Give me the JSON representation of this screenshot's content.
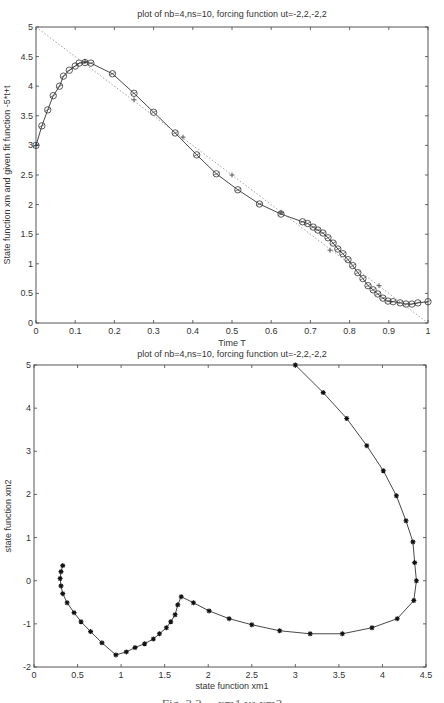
{
  "chart_data": [
    {
      "type": "line",
      "title": "plot of nb=4,ns=10, forcing function ut=-2,2,-2,2",
      "xlabel": "Time T",
      "ylabel": "State function xm and given fit function -5*t+t",
      "xlim": [
        0,
        1
      ],
      "ylim": [
        0,
        5
      ],
      "xticks": [
        "0",
        "0.1",
        "0.2",
        "0.3",
        "0.4",
        "0.5",
        "0.6",
        "0.7",
        "0.8",
        "0.9",
        "1"
      ],
      "yticks": [
        "0",
        "0.5",
        "1",
        "1.5",
        "2",
        "2.5",
        "3",
        "3.5",
        "4",
        "4.5",
        "5"
      ],
      "grid": false,
      "series": [
        {
          "name": "state function xm",
          "style": "solid line with circle markers",
          "x": [
            0,
            0.015,
            0.03,
            0.044,
            0.06,
            0.07,
            0.085,
            0.1,
            0.11,
            0.125,
            0.14,
            0.195,
            0.25,
            0.3,
            0.355,
            0.41,
            0.46,
            0.515,
            0.57,
            0.625,
            0.68,
            0.693,
            0.707,
            0.719,
            0.732,
            0.745,
            0.758,
            0.77,
            0.783,
            0.796,
            0.808,
            0.821,
            0.834,
            0.847,
            0.86,
            0.872,
            0.885,
            0.898,
            0.911,
            0.929,
            0.944,
            0.959,
            0.974,
            1.0
          ],
          "y": [
            3.0,
            3.33,
            3.6,
            3.84,
            4.0,
            4.17,
            4.27,
            4.34,
            4.39,
            4.4,
            4.39,
            4.21,
            3.88,
            3.56,
            3.21,
            2.84,
            2.52,
            2.25,
            2.01,
            1.84,
            1.71,
            1.68,
            1.62,
            1.57,
            1.52,
            1.44,
            1.35,
            1.25,
            1.17,
            1.07,
            0.97,
            0.85,
            0.75,
            0.63,
            0.56,
            0.49,
            0.42,
            0.37,
            0.36,
            0.34,
            0.32,
            0.32,
            0.34,
            0.36
          ]
        },
        {
          "name": "fit points",
          "style": "plus markers",
          "x": [
            0,
            0.125,
            0.25,
            0.375,
            0.5,
            0.625,
            0.75,
            0.875
          ],
          "y": [
            3.0,
            4.42,
            3.77,
            3.14,
            2.5,
            1.87,
            1.23,
            0.63
          ]
        },
        {
          "name": "given fit function",
          "style": "dotted line",
          "x": [
            0,
            1
          ],
          "y": [
            5,
            0
          ]
        }
      ]
    },
    {
      "type": "line",
      "title": "plot of nb=4,ns=10, forcing function ut=-2,2,-2,2",
      "xlabel": "state function xm1",
      "ylabel": "state function xm2",
      "xlim": [
        0,
        4.5
      ],
      "ylim": [
        -2,
        5
      ],
      "xticks": [
        "0",
        "0.5",
        "1",
        "1.5",
        "2",
        "2.5",
        "3",
        "3.5",
        "4",
        "4.5"
      ],
      "yticks": [
        "-2",
        "-1",
        "0",
        "1",
        "2",
        "3",
        "4",
        "5"
      ],
      "grid": false,
      "series": [
        {
          "name": "phase trajectory xm1 vs xm2",
          "style": "solid line with star markers",
          "x": [
            0.33,
            0.31,
            0.3,
            0.31,
            0.33,
            0.38,
            0.46,
            0.54,
            0.65,
            0.78,
            0.94,
            1.06,
            1.16,
            1.27,
            1.37,
            1.44,
            1.52,
            1.57,
            1.62,
            1.65,
            1.69,
            1.83,
            2.01,
            2.24,
            2.5,
            2.82,
            3.17,
            3.54,
            3.88,
            4.17,
            4.36,
            4.39,
            4.37,
            4.35,
            4.27,
            4.16,
            4.01,
            3.82,
            3.59,
            3.32,
            3.0
          ],
          "y": [
            0.35,
            0.21,
            0.05,
            -0.12,
            -0.3,
            -0.51,
            -0.74,
            -0.95,
            -1.18,
            -1.44,
            -1.72,
            -1.65,
            -1.55,
            -1.46,
            -1.35,
            -1.23,
            -1.09,
            -0.95,
            -0.79,
            -0.56,
            -0.37,
            -0.51,
            -0.7,
            -0.88,
            -1.02,
            -1.16,
            -1.23,
            -1.23,
            -1.09,
            -0.88,
            -0.46,
            0.0,
            0.42,
            0.9,
            1.39,
            1.97,
            2.55,
            3.13,
            3.76,
            4.36,
            5.0
          ]
        }
      ]
    }
  ],
  "figure": {
    "caption": "Fig. 3.3 ... xm1 vs xm2"
  }
}
